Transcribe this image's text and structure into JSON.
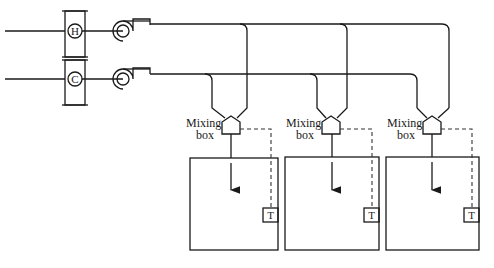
{
  "diagram": {
    "type": "dual-duct HVAC system schematic",
    "coils": [
      {
        "id": "heating-coil",
        "symbol": "H"
      },
      {
        "id": "cooling-coil",
        "symbol": "C"
      }
    ],
    "fans": [
      {
        "id": "hot-deck-fan"
      },
      {
        "id": "cold-deck-fan"
      }
    ],
    "zones": [
      {
        "mixing_label_1": "Mixing",
        "mixing_label_2": "box",
        "thermostat": "T"
      },
      {
        "mixing_label_1": "Mixing",
        "mixing_label_2": "box",
        "thermostat": "T"
      },
      {
        "mixing_label_1": "Mixing",
        "mixing_label_2": "box",
        "thermostat": "T"
      }
    ],
    "colors": {
      "line": "#1a1a1a",
      "background": "#ffffff"
    }
  }
}
